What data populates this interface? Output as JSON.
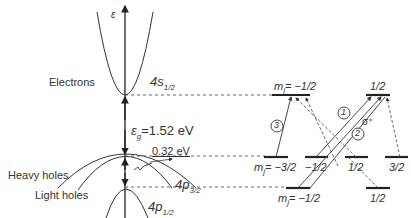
{
  "diagram": {
    "type": "band-structure-and-optical-transitions",
    "axis_label": "ε",
    "labels": {
      "electrons": "Electrons",
      "heavy_holes": "Heavy holes",
      "light_holes": "Light holes",
      "s_state": "4s",
      "s_state_sub": "1/2",
      "p32_state": "4p",
      "p32_state_sub": "3/2",
      "p12_state": "4p",
      "p12_state_sub": "1/2",
      "gap_symbol": "ε",
      "gap_sub": "g",
      "gap_value": "=1.52 eV",
      "split_value": "0.32 eV",
      "sigma": "σ⁺"
    },
    "conduction_levels": [
      {
        "label": "m",
        "sub": "j",
        "value": "= −1/2"
      },
      {
        "label": "1/2"
      }
    ],
    "valence_levels": [
      {
        "label": "m",
        "sub": "j",
        "value": "= −3/2"
      },
      {
        "label": "−1/2"
      },
      {
        "label": "1/2"
      },
      {
        "label": "3/2"
      }
    ],
    "splitoff_levels": [
      {
        "label": "m",
        "sub": "j",
        "value": "= −1/2"
      },
      {
        "label": "1/2"
      }
    ],
    "transitions": [
      {
        "id": "1",
        "from": "valence −1/2",
        "to": "conduction 1/2",
        "style": "solid"
      },
      {
        "id": "2",
        "from": "split-off −1/2",
        "to": "conduction 1/2",
        "style": "solid"
      },
      {
        "id": "3",
        "from": "valence −3/2",
        "to": "conduction −1/2",
        "style": "solid"
      }
    ]
  }
}
